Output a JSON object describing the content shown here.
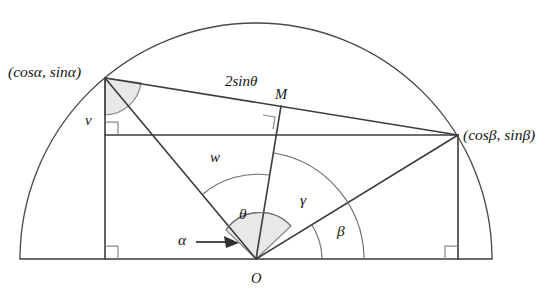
{
  "figure": {
    "background_color": "#ffffff",
    "line_color": "#3c3c3c",
    "shade_color": "#e6e6e6",
    "width": 555,
    "height": 297
  },
  "labels": {
    "point_a_coords": "(cosα, sinα)",
    "point_b_coords": "(cosβ, sinβ)",
    "chord_length": "2sinθ",
    "midpoint": "M",
    "origin": "O",
    "vertical_segment": "v",
    "horizontal_segment": "w",
    "angle_alpha": "α",
    "angle_beta": "β",
    "angle_gamma": "γ",
    "angle_theta": "θ"
  },
  "geometry": {
    "origin": {
      "x": 256,
      "y": 259
    },
    "radius": 236,
    "baseline_left": {
      "x": 20,
      "y": 259
    },
    "baseline_right": {
      "x": 492,
      "y": 259
    },
    "point_a": {
      "x": 105,
      "y": 78
    },
    "point_b": {
      "x": 458,
      "y": 135
    },
    "point_m": {
      "x": 281,
      "y": 106
    },
    "foot_a": {
      "x": 105,
      "y": 259
    },
    "foot_b": {
      "x": 458,
      "y": 259
    },
    "chord_start": {
      "x": 105,
      "y": 78
    },
    "chord_end": {
      "x": 458,
      "y": 135
    },
    "horizontal_line": {
      "x1": 105,
      "y1": 135,
      "x2": 458,
      "y2": 135
    },
    "alpha_arrow": {
      "x1": 196,
      "y1": 240,
      "x2": 235,
      "y2": 247
    }
  },
  "label_positions": {
    "point_a_coords": {
      "x": 8,
      "y": 73
    },
    "point_b_coords": {
      "x": 463,
      "y": 136
    },
    "chord_length": {
      "x": 225,
      "y": 83
    },
    "midpoint": {
      "x": 275,
      "y": 96
    },
    "origin": {
      "x": 251,
      "y": 280
    },
    "vertical_segment": {
      "x": 85,
      "y": 122
    },
    "horizontal_segment": {
      "x": 210,
      "y": 159
    },
    "angle_alpha": {
      "x": 178,
      "y": 241
    },
    "angle_beta": {
      "x": 337,
      "y": 232
    },
    "angle_gamma": {
      "x": 300,
      "y": 201
    },
    "angle_theta": {
      "x": 239,
      "y": 215
    }
  }
}
